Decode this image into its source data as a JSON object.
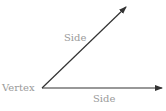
{
  "diagram": {
    "labels": {
      "side_upper": "Side",
      "vertex": "Vertex",
      "side_lower": "Side"
    },
    "colors": {
      "ray": "#333333",
      "label": "#9a9a9a"
    },
    "geometry": {
      "vertex": [
        42,
        88
      ],
      "upper_ray_end": [
        126,
        7
      ],
      "lower_ray_end": [
        162,
        88
      ]
    }
  }
}
